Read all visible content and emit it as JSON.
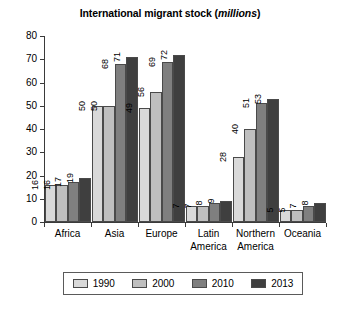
{
  "chart_data": {
    "type": "bar",
    "title": "International migrant stock (millions)",
    "title_main": "International migrant stock (",
    "title_unit": "millions",
    "title_tail": ")",
    "xlabel": "",
    "ylabel": "",
    "ylim": [
      0,
      80
    ],
    "yticks": [
      0,
      10,
      20,
      30,
      40,
      50,
      60,
      70,
      80
    ],
    "ytick_labels": [
      "0",
      "10",
      "20",
      "30",
      "40",
      "50",
      "60",
      "70",
      "80"
    ],
    "grid": false,
    "legend_position": "bottom",
    "categories": [
      "Africa",
      "Asia",
      "Europe",
      "Latin America",
      "Northern America",
      "Oceania"
    ],
    "category_labels": [
      "Africa",
      "Asia",
      "Europe",
      "Latin\nAmerica",
      "Northern\nAmerica",
      "Oceania"
    ],
    "series": [
      {
        "name": "1990",
        "color": "#d9d9d9",
        "values": [
          16,
          50,
          49,
          7,
          28,
          5
        ]
      },
      {
        "name": "2000",
        "color": "#bfbfbf",
        "values": [
          16,
          50,
          56,
          7,
          40,
          5
        ]
      },
      {
        "name": "2010",
        "color": "#7f7f7f",
        "values": [
          17,
          68,
          69,
          8,
          51,
          7
        ]
      },
      {
        "name": "2013",
        "color": "#3f3f3f",
        "values": [
          19,
          71,
          72,
          9,
          53,
          8
        ]
      }
    ]
  },
  "legend": {
    "items": [
      {
        "label": "1990",
        "color": "#d9d9d9"
      },
      {
        "label": "2000",
        "color": "#bfbfbf"
      },
      {
        "label": "2010",
        "color": "#7f7f7f"
      },
      {
        "label": "2013",
        "color": "#3f3f3f"
      }
    ]
  },
  "axis": {
    "y_max_label": "80",
    "y_min_label": "0"
  }
}
